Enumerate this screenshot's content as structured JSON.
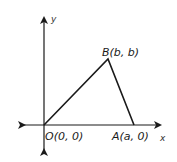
{
  "diagram": {
    "type": "coordinate-plane-triangle",
    "axes": {
      "x_label": "x",
      "y_label": "y"
    },
    "points": {
      "origin": {
        "label": "O(0, 0)"
      },
      "a": {
        "label": "A(a, 0)"
      },
      "b": {
        "label": "B(b, b)"
      }
    },
    "colors": {
      "stroke": "#1a1a1a",
      "background": "#ffffff"
    }
  }
}
